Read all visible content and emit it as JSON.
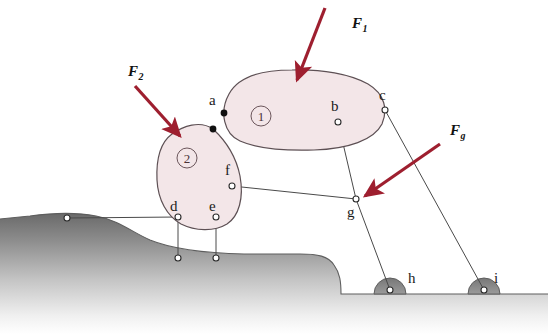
{
  "figure": {
    "colors": {
      "body_fill": "#f3e6e8",
      "body_stroke": "#5d5054",
      "force_arrow": "#9e1f2f",
      "ground_dark": "#6e6e6e",
      "link_line": "#4a4a4a",
      "node_fill": "#ffffff",
      "node_stroke": "#2b2b2b",
      "joint_fill": "#111111",
      "background": "#ffffff"
    }
  },
  "forces": [
    {
      "id": "F1",
      "base": "F",
      "sub": "1",
      "label": "F1",
      "label_x": 352,
      "label_y": 28,
      "tail_x": 325,
      "tail_y": 8,
      "tip_x": 297,
      "tip_y": 80
    },
    {
      "id": "F2",
      "base": "F",
      "sub": "2",
      "label": "F2",
      "label_x": 128,
      "label_y": 76,
      "tail_x": 135,
      "tail_y": 86,
      "tip_x": 180,
      "tip_y": 136
    },
    {
      "id": "Fg",
      "base": "F",
      "sub": "g",
      "label": "Fg",
      "label_x": 450,
      "label_y": 135,
      "tail_x": 440,
      "tail_y": 144,
      "tip_x": 365,
      "tip_y": 196
    }
  ],
  "bodies": [
    {
      "id": "body1",
      "number": "1",
      "num_x": 261,
      "num_y": 116,
      "num_r": 10
    },
    {
      "id": "body2",
      "number": "2",
      "num_x": 187,
      "num_y": 158,
      "num_r": 10
    }
  ],
  "nodes": [
    {
      "id": "a",
      "label": "a",
      "x": 224,
      "y": 113,
      "lx": 209,
      "ly": 105,
      "kind": "joint"
    },
    {
      "id": "a2",
      "label": "",
      "x": 213,
      "y": 129,
      "lx": 0,
      "ly": 0,
      "kind": "joint"
    },
    {
      "id": "b",
      "label": "b",
      "x": 338,
      "y": 122,
      "lx": 331,
      "ly": 111,
      "kind": "pin"
    },
    {
      "id": "c",
      "label": "c",
      "x": 385,
      "y": 110,
      "lx": 379,
      "ly": 100,
      "kind": "pin"
    },
    {
      "id": "d",
      "label": "d",
      "x": 178,
      "y": 217,
      "lx": 170,
      "ly": 211,
      "kind": "pin"
    },
    {
      "id": "e",
      "label": "e",
      "x": 216,
      "y": 217,
      "lx": 209,
      "ly": 211,
      "kind": "pin"
    },
    {
      "id": "f",
      "label": "f",
      "x": 232,
      "y": 186,
      "lx": 225,
      "ly": 175,
      "kind": "pin"
    },
    {
      "id": "g",
      "label": "g",
      "x": 356,
      "y": 199,
      "lx": 347,
      "ly": 217,
      "kind": "pin"
    },
    {
      "id": "h",
      "label": "h",
      "x": 390,
      "y": 290,
      "lx": 408,
      "ly": 283,
      "kind": "support"
    },
    {
      "id": "i",
      "label": "i",
      "x": 484,
      "y": 290,
      "lx": 494,
      "ly": 283,
      "kind": "support"
    },
    {
      "id": "anchor-left",
      "label": "",
      "x": 67,
      "y": 218,
      "lx": 0,
      "ly": 0,
      "kind": "pin"
    },
    {
      "id": "ground-d",
      "label": "",
      "x": 178,
      "y": 258,
      "lx": 0,
      "ly": 0,
      "kind": "pin"
    },
    {
      "id": "ground-e",
      "label": "",
      "x": 216,
      "y": 258,
      "lx": 0,
      "ly": 0,
      "kind": "pin"
    }
  ],
  "links": [
    {
      "id": "link-b-g",
      "from": "b",
      "to": "g"
    },
    {
      "id": "link-c-i",
      "from": "c",
      "to": "i"
    },
    {
      "id": "link-g-h",
      "from": "g",
      "to": "h"
    },
    {
      "id": "link-f-g",
      "from": "f",
      "to": "g"
    },
    {
      "id": "link-d-ground",
      "from": "d",
      "to": "ground-d"
    },
    {
      "id": "link-e-ground",
      "from": "e",
      "to": "ground-e"
    },
    {
      "id": "link-d-anchor",
      "from": "d",
      "to": "anchor-left"
    }
  ],
  "geometry": {
    "body1_path": "M 229,94 C 238,77 262,70 292,70 C 322,69 350,74 368,84 C 385,94 388,110 382,124 C 374,140 348,149 314,150 C 282,151 256,148 240,141 C 224,134 219,112 229,94 Z",
    "body2_path": "M 213,129 C 226,141 236,156 240,176 C 244,198 239,216 227,224 C 214,232 195,231 181,224 C 167,216 158,200 157,180 C 156,158 161,142 172,134 C 183,126 200,120 213,129 Z",
    "ground_path": "M 0,219 L 30,216 C 52,213 75,212 96,216 C 118,220 132,232 150,240 C 172,249 200,253 244,254 L 300,254 C 318,254 328,256 334,265 C 340,273 341,282 341,294 L 548,294 L 548,334 L 0,334 Z",
    "bump_h_cx": 390,
    "bump_i_cx": 484,
    "bump_cy": 294,
    "bump_r": 16
  },
  "dimensions": {
    "width": 548,
    "height": 334
  }
}
